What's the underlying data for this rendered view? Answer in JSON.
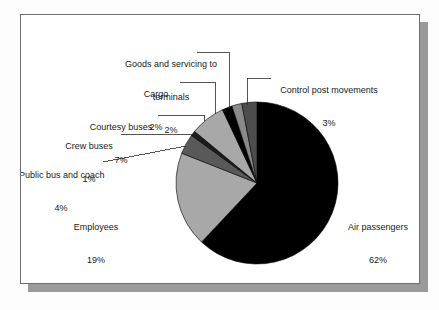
{
  "figure": {
    "background_color": "#ffffff",
    "frame_color": "#6e6e6e",
    "shadow_color": "#9a9a9a",
    "text_color": "#1a1a1a"
  },
  "chart_data": {
    "type": "pie",
    "title": "",
    "subtitle": "",
    "xlabel": "",
    "ylabel": "",
    "legend_position": "none",
    "grid": false,
    "value_unit": "%",
    "start_angle_deg": 0,
    "direction": "clockwise",
    "center": {
      "x": 256,
      "y": 182
    },
    "radius": 81,
    "categories": [
      "Air passengers",
      "Employees",
      "Public bus and coach",
      "Crew buses",
      "Courtesy buses",
      "Goods and servicing to terminals",
      "Cargo",
      "Control post movements"
    ],
    "values": [
      62,
      19,
      4,
      1,
      7,
      2,
      2,
      3
    ],
    "labels": [
      "Air passengers\n62%",
      "Employees\n19%",
      "Public bus and coach\n4%",
      "Crew buses\n1%",
      "Courtesy buses\n7%",
      "Goods and servicing to terminals\n2%",
      "Cargo\n2%",
      "Control post movements\n3%"
    ],
    "colors": [
      "#000000",
      "#a8a8a8",
      "#595959",
      "#1c1c1c",
      "#a8a8a8",
      "#000000",
      "#8a8a8a",
      "#4d4d4d"
    ],
    "slices": [
      {
        "name": "Air passengers",
        "percent": "62%",
        "value": 62,
        "color": "#000000"
      },
      {
        "name": "Employees",
        "percent": "19%",
        "value": 19,
        "color": "#a8a8a8"
      },
      {
        "name": "Public bus and coach",
        "percent": "4%",
        "value": 4,
        "color": "#595959"
      },
      {
        "name": "Crew buses",
        "percent": "1%",
        "value": 1,
        "color": "#1c1c1c"
      },
      {
        "name": "Courtesy buses",
        "percent": "7%",
        "value": 7,
        "color": "#a8a8a8"
      },
      {
        "name": "Goods and servicing to terminals",
        "percent": "2%",
        "value": 2,
        "color": "#000000"
      },
      {
        "name": "Cargo",
        "percent": "2%",
        "value": 2,
        "color": "#8a8a8a"
      },
      {
        "name": "Control post movements",
        "percent": "3%",
        "value": 3,
        "color": "#4d4d4d"
      }
    ]
  },
  "annotations": {
    "goods_line1": "Goods and servicing to",
    "goods_line2": "terminals",
    "goods_pct": "2%",
    "cargo_name": "Cargo",
    "cargo_pct": "2%",
    "control_name": "Control post movements",
    "control_pct": "3%",
    "courtesy_name": "Courtesy buses",
    "courtesy_pct": "7%",
    "crew_name": "Crew buses",
    "crew_pct": "1%",
    "publicbus_name": "Public bus and coach",
    "publicbus_pct": "4%",
    "employees_name": "Employees",
    "employees_pct": "19%",
    "air_name": "Air passengers",
    "air_pct": "62%"
  }
}
